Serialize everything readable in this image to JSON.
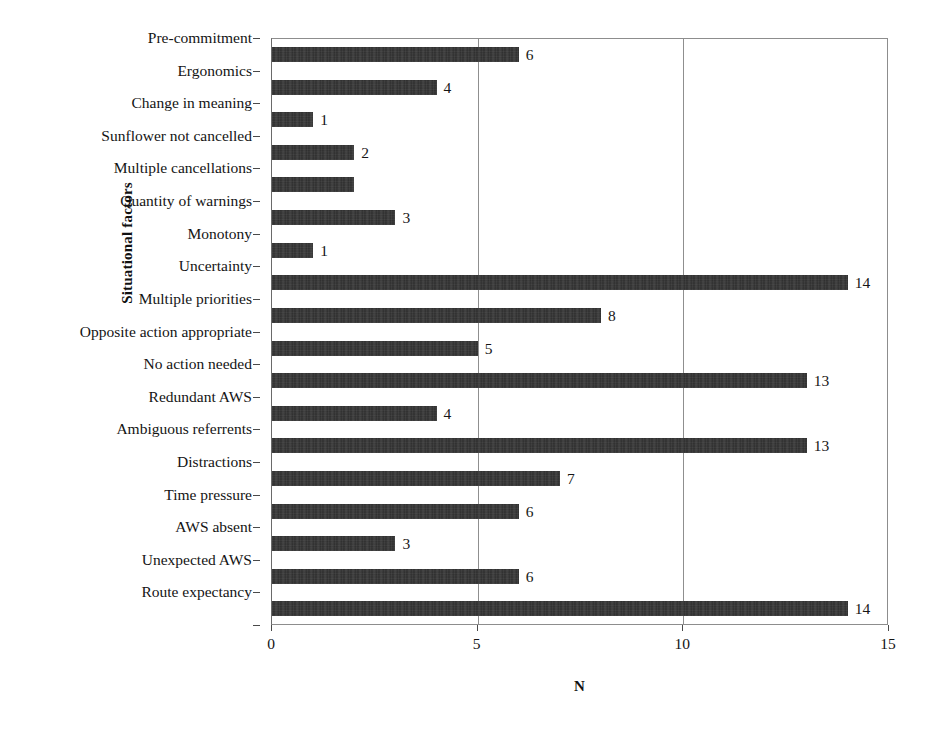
{
  "chart_data": {
    "type": "bar",
    "orientation": "horizontal",
    "title": "",
    "subtitle": "",
    "xlabel": "N",
    "ylabel": "Situational factors",
    "xlim": [
      0,
      15
    ],
    "xticks": [
      0,
      5,
      10,
      15
    ],
    "xtick_labels": [
      "0",
      "5",
      "10",
      "15"
    ],
    "grid": "vertical",
    "legend": "none",
    "bar_color": "#2b2b2b",
    "data_labels_shown": true,
    "categories": [
      "Pre-commitment",
      "Ergonomics",
      "Change in meaning",
      "Sunflower not cancelled",
      "Multiple cancellations",
      "Quantity of warnings",
      "Monotony",
      "Uncertainty",
      "Multiple priorities",
      "Opposite action appropriate",
      "No action needed",
      "Redundant AWS",
      "Ambiguous referrents",
      "Distractions",
      "Time pressure",
      "AWS absent",
      "Unexpected AWS",
      "Route expectancy"
    ],
    "values": [
      6,
      4,
      1,
      2,
      2,
      3,
      1,
      14,
      8,
      5,
      13,
      4,
      13,
      7,
      6,
      3,
      6,
      14
    ],
    "value_labels": [
      "6",
      "4",
      "1",
      "2",
      "",
      "3",
      "1",
      "14",
      "8",
      "5",
      "13",
      "4",
      "13",
      "7",
      "6",
      "3",
      "6",
      "14"
    ]
  }
}
